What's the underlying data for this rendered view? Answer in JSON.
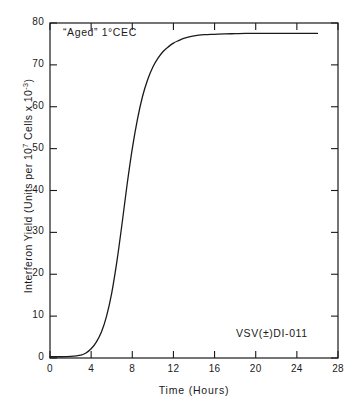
{
  "chart_data": {
    "type": "line",
    "title": "",
    "xlabel": "Time (Hours)",
    "ylabel": "Interferon Yield (Units per 10⁷ Cells x 10⁻³)",
    "ylabel_parts": {
      "prefix": "Interferon Yield (Units per 10",
      "sup1": "7",
      "middle": " Cells x 10",
      "sup2": "-3",
      "suffix": ")"
    },
    "xlim": [
      0,
      28
    ],
    "ylim": [
      0,
      80
    ],
    "xticks": [
      0,
      4,
      8,
      12,
      16,
      20,
      24,
      28
    ],
    "yticks": [
      0,
      10,
      20,
      30,
      40,
      50,
      60,
      70,
      80
    ],
    "xtick_labels": [
      "0",
      "4",
      "8",
      "12",
      "16",
      "20",
      "24",
      "28"
    ],
    "ytick_labels": [
      "0",
      "10",
      "20",
      "30",
      "40",
      "50",
      "60",
      "70",
      "80"
    ],
    "grid": false,
    "legend": "none",
    "line_color": "#1a1a1a",
    "line_width": 1.3,
    "series": [
      {
        "name": "Interferon yield",
        "x": [
          0,
          1,
          2,
          3,
          3.5,
          4,
          4.5,
          5,
          5.5,
          6,
          6.5,
          7,
          7.5,
          8,
          8.5,
          9,
          9.5,
          10,
          10.5,
          11,
          11.5,
          12,
          12.5,
          13,
          14,
          15,
          16,
          17,
          18,
          19,
          20,
          21,
          22,
          23,
          24,
          25,
          26
        ],
        "y": [
          0.3,
          0.3,
          0.4,
          0.7,
          1.2,
          2.2,
          3.8,
          6.2,
          10.0,
          15.5,
          23.0,
          32.0,
          41.5,
          50.0,
          57.0,
          62.5,
          66.5,
          69.5,
          71.6,
          73.2,
          74.3,
          75.2,
          75.8,
          76.3,
          76.9,
          77.2,
          77.3,
          77.4,
          77.45,
          77.5,
          77.5,
          77.5,
          77.5,
          77.5,
          77.5,
          77.5,
          77.5
        ]
      }
    ],
    "annotations": [
      {
        "name": "sample-label",
        "text": "“Aged” 1°CEC",
        "x": 1,
        "y": 78
      },
      {
        "name": "virus-label",
        "text": "VSV(±)DI-011",
        "x": 18.5,
        "y": 7
      }
    ]
  },
  "axes": {
    "x_axis_label": "Time (Hours)",
    "y_axis_label": "Interferon Yield (Units per 10⁷ Cells x 10⁻³)"
  }
}
